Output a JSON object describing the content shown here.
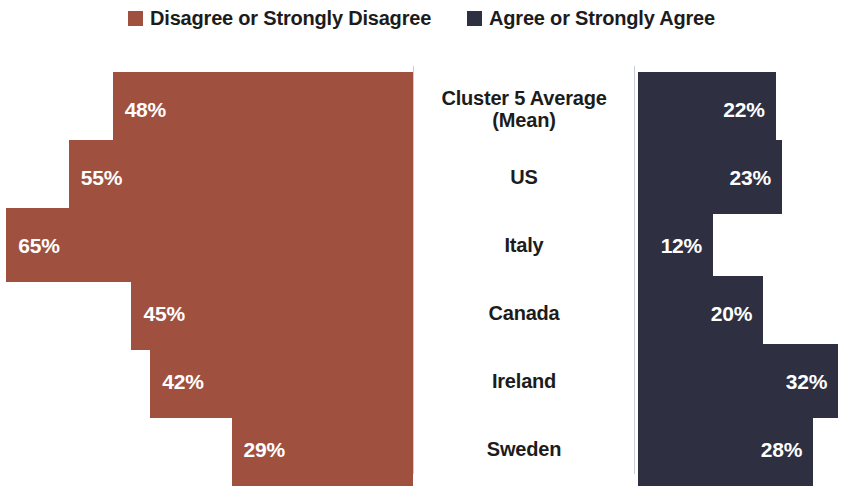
{
  "legend": {
    "entries": [
      {
        "label": "Disagree or Strongly Disagree",
        "color": "#A0503F"
      },
      {
        "label": "Agree or Strongly Agree",
        "color": "#2E3042"
      }
    ]
  },
  "chart_data": {
    "type": "bar",
    "orientation": "horizontal",
    "layout": "diverging-butterfly",
    "title": "",
    "subtitle": "",
    "xlabel": "",
    "ylabel": "",
    "grid": false,
    "legend_position": "top-center",
    "axis_max_percent": 66,
    "value_suffix": "%",
    "categories": [
      "Cluster 5 Average\n(Mean)",
      "US",
      "Italy",
      "Canada",
      "Ireland",
      "Sweden"
    ],
    "series": [
      {
        "name": "Disagree or Strongly Disagree",
        "side": "left",
        "color": "#A0503F",
        "values": [
          48,
          55,
          65,
          45,
          42,
          29
        ],
        "labels": [
          "48%",
          "55%",
          "65%",
          "45%",
          "42%",
          "29%"
        ]
      },
      {
        "name": "Agree or Strongly Agree",
        "side": "right",
        "color": "#2E3042",
        "values": [
          22,
          23,
          12,
          20,
          32,
          28
        ],
        "labels": [
          "22%",
          "23%",
          "12%",
          "20%",
          "32%",
          "28%"
        ]
      }
    ]
  }
}
